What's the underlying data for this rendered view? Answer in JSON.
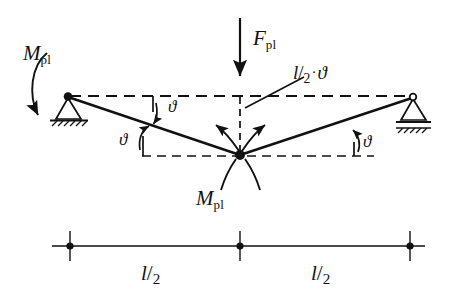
{
  "figure": {
    "type": "engineering-diagram",
    "colors": {
      "ink": "#111111",
      "background": "#ffffff"
    }
  },
  "labels": {
    "moment_left": {
      "symbol": "M",
      "subscript": "pl"
    },
    "moment_center": {
      "symbol": "M",
      "subscript": "pl"
    },
    "force": {
      "symbol": "F",
      "subscript": "pl"
    },
    "deflection": {
      "numerator": "l",
      "slash": "/",
      "denominator": "2",
      "operator": "·",
      "angle": "ϑ"
    },
    "angle_upper_left": "ϑ",
    "angle_lower_left": "ϑ",
    "angle_right": "ϑ",
    "dim_left": {
      "numerator": "l",
      "slash": "/",
      "denominator": "2"
    },
    "dim_right": {
      "numerator": "l",
      "slash": "/",
      "denominator": "2"
    }
  },
  "geometry": {
    "left_node": {
      "x": 68,
      "y": 96
    },
    "right_node": {
      "x": 413,
      "y": 97
    },
    "center_hinge": {
      "x": 240,
      "y": 155
    },
    "force_arrow": {
      "x": 240,
      "y_top": 18,
      "y_bottom": 80
    },
    "dimension_line": {
      "y": 246,
      "x_left": 52,
      "x_center": 240,
      "x_right": 425
    },
    "supports": {
      "left": "pinned",
      "right": "roller"
    }
  }
}
